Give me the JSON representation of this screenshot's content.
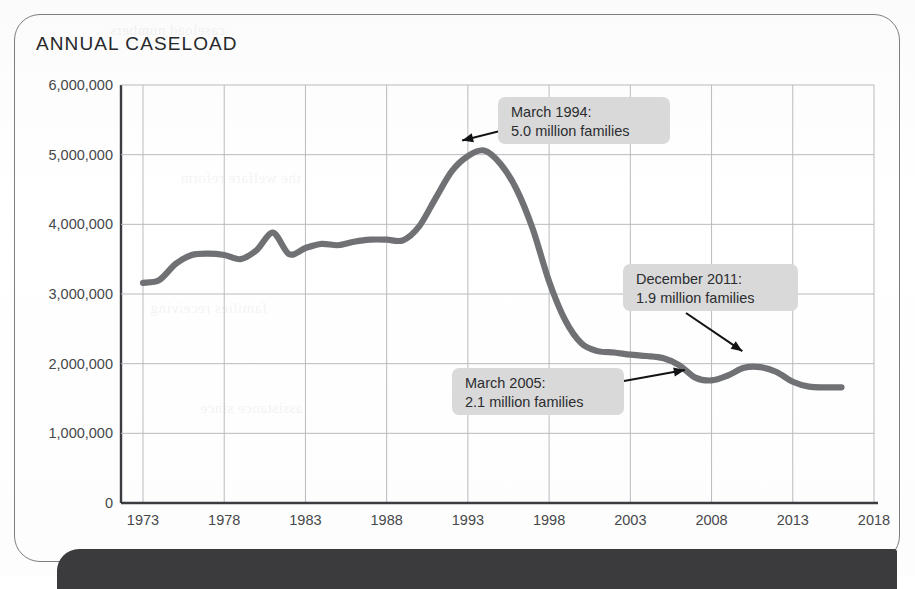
{
  "card": {
    "title": "ANNUAL CASELOAD"
  },
  "ghost_text": [
    "caseload numbers",
    "the welfare reform",
    "families receiving",
    "assistance since"
  ],
  "chart_data": {
    "type": "line",
    "title": "ANNUAL CASELOAD",
    "xlabel": "",
    "ylabel": "",
    "xlim": [
      1973,
      2018
    ],
    "ylim": [
      0,
      6000000
    ],
    "grid": true,
    "legend": "none",
    "line_color": "#6f7174",
    "x_ticks": [
      "1973",
      "1978",
      "1983",
      "1988",
      "1993",
      "1998",
      "2003",
      "2008",
      "2013",
      "2018"
    ],
    "x_tick_values": [
      1973,
      1978,
      1983,
      1988,
      1993,
      1998,
      2003,
      2008,
      2013,
      2018
    ],
    "y_ticks": [
      "0",
      "1,000,000",
      "2,000,000",
      "3,000,000",
      "4,000,000",
      "5,000,000",
      "6,000,000"
    ],
    "y_tick_values": [
      0,
      1000000,
      2000000,
      3000000,
      4000000,
      5000000,
      6000000
    ],
    "x": [
      1973,
      1974,
      1975,
      1976,
      1977,
      1978,
      1979,
      1980,
      1981,
      1982,
      1983,
      1984,
      1985,
      1986,
      1987,
      1988,
      1989,
      1990,
      1991,
      1992,
      1993,
      1994,
      1995,
      1996,
      1997,
      1998,
      1999,
      2000,
      2001,
      2002,
      2003,
      2004,
      2005,
      2006,
      2007,
      2008,
      2009,
      2010,
      2011,
      2012,
      2013,
      2014,
      2015,
      2016
    ],
    "values": [
      3160000,
      3200000,
      3430000,
      3560000,
      3580000,
      3560000,
      3500000,
      3630000,
      3880000,
      3570000,
      3660000,
      3720000,
      3700000,
      3750000,
      3780000,
      3780000,
      3770000,
      3970000,
      4370000,
      4760000,
      4980000,
      5060000,
      4870000,
      4500000,
      3930000,
      3180000,
      2620000,
      2290000,
      2180000,
      2160000,
      2130000,
      2110000,
      2080000,
      1980000,
      1800000,
      1760000,
      1830000,
      1940000,
      1950000,
      1880000,
      1740000,
      1670000,
      1660000,
      1660000
    ],
    "annotations": [
      {
        "id": "peak-1994",
        "line1": "March 1994:",
        "line2": "5.0 million families",
        "point_x": 1994,
        "point_y": 5060000
      },
      {
        "id": "mar-2005",
        "line1": "March 2005:",
        "line2": "2.1 million families",
        "point_x": 2005,
        "point_y": 2110000
      },
      {
        "id": "dec-2011",
        "line1": "December 2011:",
        "line2": "1.9 million families",
        "point_x": 2011,
        "point_y": 1950000
      }
    ]
  }
}
